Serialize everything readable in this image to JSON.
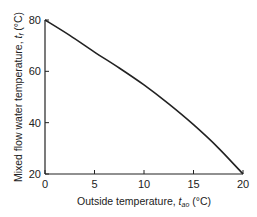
{
  "chart_data": {
    "type": "line",
    "title": "",
    "xlabel": "Outside temperature, t_ao (°C)",
    "xlabel_main": "Outside temperature, ",
    "xlabel_var": "t",
    "xlabel_sub": "ao",
    "xlabel_unit": " (°C)",
    "ylabel": "Mixed flow water temperature, t_f (°C)",
    "ylabel_main": "Mixed flow water temperature, ",
    "ylabel_var": "t",
    "ylabel_sub": "f",
    "ylabel_unit": " (°C)",
    "xlim": [
      0,
      20
    ],
    "ylim": [
      20,
      80
    ],
    "xticks": [
      0,
      5,
      10,
      15,
      20
    ],
    "yticks": [
      20,
      40,
      60,
      80
    ],
    "grid": false,
    "series": [
      {
        "name": "Mixed flow water temperature",
        "x": [
          0,
          2.5,
          5,
          7.5,
          10,
          12.5,
          15,
          17.5,
          20
        ],
        "values": [
          80,
          74,
          67.5,
          61.3,
          54.7,
          47.3,
          39.2,
          30.2,
          20
        ]
      }
    ]
  }
}
